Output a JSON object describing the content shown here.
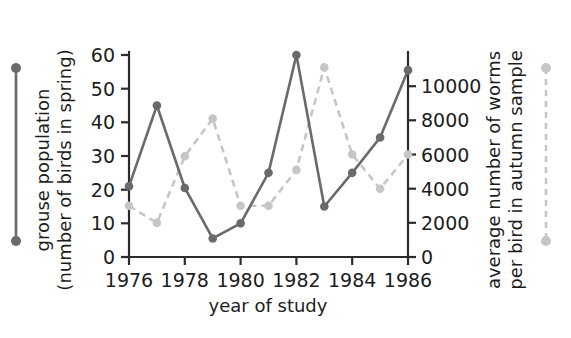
{
  "chart_data": {
    "type": "line",
    "title": "",
    "xlabel": "year of study",
    "x": [
      1976,
      1977,
      1978,
      1979,
      1980,
      1981,
      1982,
      1983,
      1984,
      1985,
      1986
    ],
    "xlim": [
      1976,
      1986
    ],
    "xticks": [
      1976,
      1978,
      1980,
      1982,
      1984,
      1986
    ],
    "xtick_labels": [
      "1976",
      "1978",
      "1980",
      "1982",
      "1984",
      "1986"
    ],
    "grid": false,
    "legend_position": "outside-left-and-right",
    "axes": [
      {
        "id": "left",
        "side": "left",
        "label": "grouse population (number of birds in spring)",
        "label_line1": "grouse population",
        "label_line2": "(number of birds in spring)",
        "lim": [
          0,
          60
        ],
        "ticks": [
          0,
          10,
          20,
          30,
          40,
          50,
          60
        ],
        "tick_labels": [
          "0",
          "10",
          "20",
          "30",
          "40",
          "50",
          "60"
        ],
        "color": "#6a6a6a"
      },
      {
        "id": "right",
        "side": "right",
        "label": "average number of worms per bird in autumn sample",
        "label_line1": "average number of worms",
        "label_line2": "per bird in autumn sample",
        "lim": [
          0,
          12000
        ],
        "ticks": [
          0,
          2000,
          4000,
          6000,
          8000,
          10000
        ],
        "tick_labels": [
          "0",
          "2000",
          "4000",
          "6000",
          "8000",
          "10000"
        ],
        "color": "#c6c6c6"
      }
    ],
    "series": [
      {
        "name": "grouse population (number of birds in spring)",
        "axis": "left",
        "style": "solid",
        "color": "#6a6a6a",
        "marker": "circle",
        "values": [
          21,
          45,
          20.5,
          5.5,
          10,
          25,
          60,
          15,
          25,
          35.5,
          55.5
        ]
      },
      {
        "name": "average number of worms per bird in autumn sample",
        "axis": "right",
        "style": "dashed",
        "color": "#c6c6c6",
        "marker": "circle",
        "values": [
          3000,
          2000,
          5900,
          8100,
          3000,
          3000,
          5100,
          11100,
          6000,
          4000,
          6000
        ]
      }
    ]
  },
  "legend": {
    "left_key_name": "grouse-population-key",
    "right_key_name": "worms-per-bird-key"
  }
}
